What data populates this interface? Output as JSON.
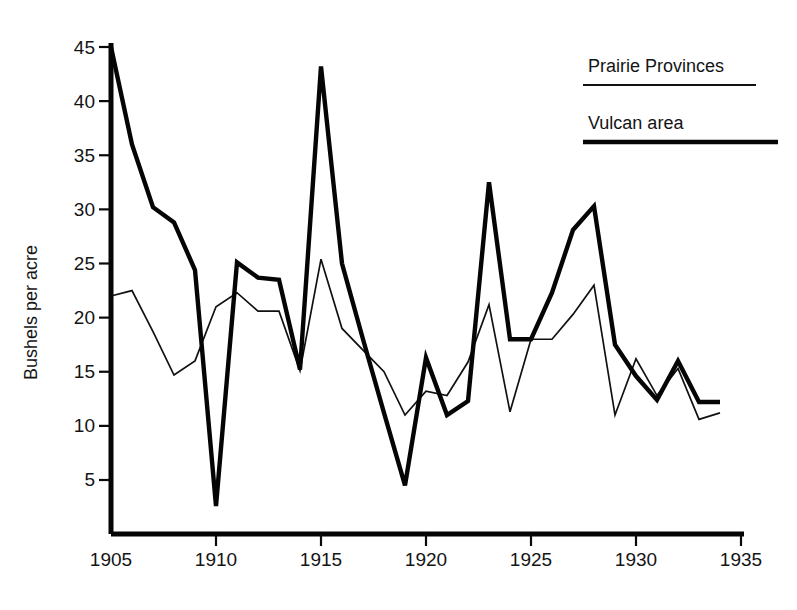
{
  "chart_data": {
    "type": "line",
    "title": "",
    "subtitle": "",
    "xlabel": "",
    "ylabel": "Bushels per acre",
    "xlim": [
      1905,
      1935
    ],
    "ylim": [
      0,
      45
    ],
    "grid": false,
    "legend_position": "top-right",
    "x_ticks": [
      1905,
      1910,
      1915,
      1920,
      1925,
      1930,
      1935
    ],
    "y_ticks": [
      5,
      10,
      15,
      20,
      25,
      30,
      35,
      40,
      45
    ],
    "x": [
      1905,
      1906,
      1907,
      1908,
      1909,
      1910,
      1911,
      1912,
      1913,
      1914,
      1915,
      1916,
      1917,
      1918,
      1919,
      1920,
      1921,
      1922,
      1923,
      1924,
      1925,
      1926,
      1927,
      1928,
      1929,
      1930,
      1931,
      1932,
      1933,
      1934
    ],
    "series": [
      {
        "name": "Prairie Provinces",
        "style": "thin",
        "stroke_width": 1.7,
        "color": "#111111",
        "values": [
          22.0,
          22.5,
          18.7,
          14.7,
          16.0,
          21.0,
          22.3,
          20.6,
          20.6,
          15.1,
          25.4,
          19.0,
          17.0,
          15.0,
          11.0,
          13.2,
          12.8,
          15.9,
          21.2,
          11.3,
          18.0,
          18.0,
          20.3,
          23.0,
          11.0,
          16.2,
          12.8,
          15.3,
          10.6,
          11.2
        ]
      },
      {
        "name": "Vulcan area",
        "style": "thick",
        "stroke_width": 4.4,
        "color": "#050505",
        "values": [
          45.0,
          36.0,
          30.2,
          28.8,
          24.4,
          2.6,
          25.1,
          23.7,
          23.5,
          15.2,
          43.2,
          25.0,
          18.0,
          11.2,
          4.5,
          16.3,
          11.0,
          12.3,
          32.5,
          18.0,
          18.0,
          22.3,
          28.1,
          30.3,
          17.5,
          14.6,
          12.4,
          16.0,
          12.2,
          12.2
        ]
      }
    ],
    "legend": [
      {
        "label": "Prairie Provinces",
        "style": "thin"
      },
      {
        "label": "Vulcan area",
        "style": "thick"
      }
    ]
  },
  "axis": {
    "y_label": "Bushels per acre",
    "y_tick_labels": [
      "45",
      "40",
      "35",
      "30",
      "25",
      "20",
      "15",
      "10",
      "5"
    ],
    "x_tick_labels": [
      "1905",
      "1910",
      "1915",
      "1920",
      "1925",
      "1930",
      "1935"
    ]
  },
  "legend": {
    "entry_prairie": "Prairie Provinces",
    "entry_vulcan": "Vulcan area"
  }
}
